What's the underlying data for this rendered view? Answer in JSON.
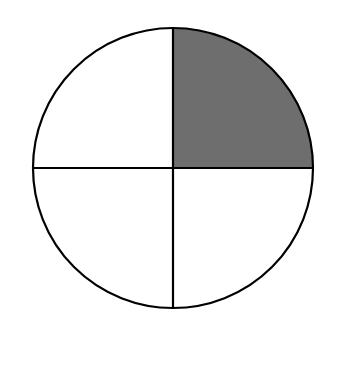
{
  "diagram": {
    "type": "fraction-circle",
    "total_parts": 4,
    "shaded_parts": 1,
    "shaded_quadrant": "top-right",
    "fraction": "1/4",
    "colors": {
      "shade": "#6e6e6e",
      "stroke": "#000000",
      "background": "#ffffff"
    }
  }
}
